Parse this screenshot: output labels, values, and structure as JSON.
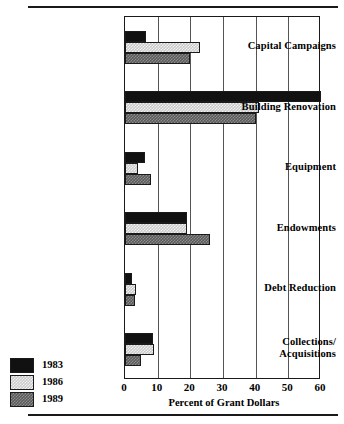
{
  "chart_data": {
    "type": "bar",
    "orientation": "horizontal",
    "title": "",
    "xlabel": "Percent of  Grant Dollars",
    "ylabel": "",
    "xlim": [
      0,
      60
    ],
    "xticks": [
      0,
      10,
      20,
      30,
      40,
      50,
      60
    ],
    "grid": true,
    "grid_axis": "x",
    "legend_position": "bottom-left",
    "categories": [
      "Capital Campaigns",
      "Building Renovation",
      "Equipment",
      "Endowments",
      "Debt Reduction",
      "Collections/\nAcquisitions"
    ],
    "series": [
      {
        "name": "1983",
        "color": "#111111",
        "values": [
          6.5,
          60,
          6,
          19,
          2,
          8.5
        ]
      },
      {
        "name": "1986",
        "color": "#c9c9c9",
        "values": [
          23,
          41,
          4,
          19,
          3.5,
          9
        ]
      },
      {
        "name": "1989",
        "color": "#5a5a5a",
        "values": [
          20,
          40,
          8,
          26,
          3,
          5
        ]
      }
    ]
  },
  "axis": {
    "tick_labels": [
      "0",
      "10",
      "20",
      "30",
      "40",
      "50",
      "60"
    ],
    "title": "Percent of  Grant Dollars"
  },
  "categories": [
    {
      "label": "Capital Campaigns",
      "line2": ""
    },
    {
      "label": "Building Renovation",
      "line2": ""
    },
    {
      "label": "Equipment",
      "line2": ""
    },
    {
      "label": "Endowments",
      "line2": ""
    },
    {
      "label": "Debt Reduction",
      "line2": ""
    },
    {
      "label": "Collections/",
      "line2": "Acquisitions"
    }
  ],
  "legend": {
    "items": [
      {
        "label": "1983",
        "color": "#111111"
      },
      {
        "label": "1986",
        "color": "#c9c9c9"
      },
      {
        "label": "1989",
        "color": "#5a5a5a"
      }
    ]
  }
}
